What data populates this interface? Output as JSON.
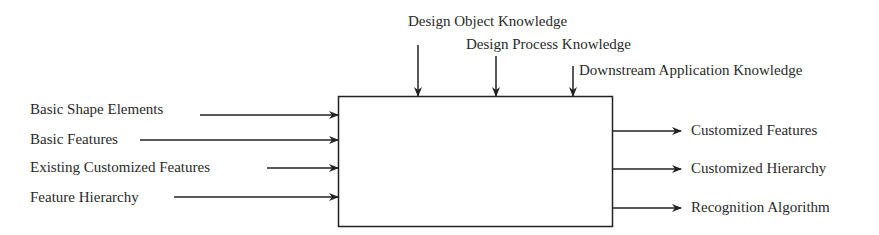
{
  "diagram": {
    "type": "IDEF0 function block",
    "controls": [
      {
        "label": "Design Object Knowledge"
      },
      {
        "label": "Design Process Knowledge"
      },
      {
        "label": "Downstream Application Knowledge"
      }
    ],
    "inputs": [
      {
        "label": "Basic Shape Elements"
      },
      {
        "label": "Basic Features"
      },
      {
        "label": "Existing Customized Features"
      },
      {
        "label": "Feature Hierarchy"
      }
    ],
    "outputs": [
      {
        "label": "Customized Features"
      },
      {
        "label": "Customized Hierarchy"
      },
      {
        "label": "Recognition Algorithm"
      }
    ],
    "box_label": ""
  }
}
